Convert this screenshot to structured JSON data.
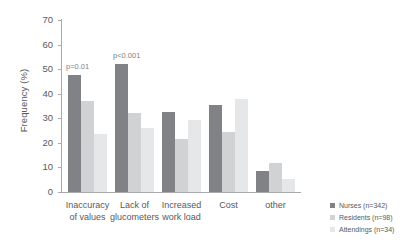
{
  "chart_data": {
    "type": "bar",
    "title": "",
    "xlabel": "",
    "ylabel": "Frequency (%)",
    "ylim": [
      0,
      70
    ],
    "yticks": [
      0,
      10,
      20,
      30,
      40,
      50,
      60,
      70
    ],
    "grid": false,
    "legend_position": "right",
    "categories": [
      "Inaccuracy of values",
      "Lack of glucometers",
      "Increased work load",
      "Cost",
      "other"
    ],
    "category_lines": [
      [
        "Inaccuracy",
        "of values"
      ],
      [
        "Lack of",
        "glucometers"
      ],
      [
        "Increased",
        "work load"
      ],
      [
        "Cost",
        ""
      ],
      [
        "other",
        ""
      ]
    ],
    "series": [
      {
        "name": "Nurses (n=342)",
        "color": "#808285",
        "values": [
          47.5,
          52.0,
          32.5,
          35.5,
          8.5
        ]
      },
      {
        "name": "Residents (n=98)",
        "color": "#d0d2d3",
        "values": [
          37.0,
          32.0,
          21.5,
          24.5,
          12.0
        ]
      },
      {
        "name": "Attendings (n=34)",
        "color": "#e6e7e8",
        "values": [
          23.5,
          26.0,
          29.5,
          38.0,
          5.5
        ]
      }
    ],
    "annotations": [
      {
        "text": "p=0.01",
        "category": "Inaccuracy of values"
      },
      {
        "text": "p<0.001",
        "category": "Lack of glucometers"
      }
    ]
  },
  "legend": {
    "items": [
      {
        "label": "Nurses (n=342)"
      },
      {
        "label": "Residents (n=98)"
      },
      {
        "label": "Attendings (n=34)"
      }
    ]
  }
}
